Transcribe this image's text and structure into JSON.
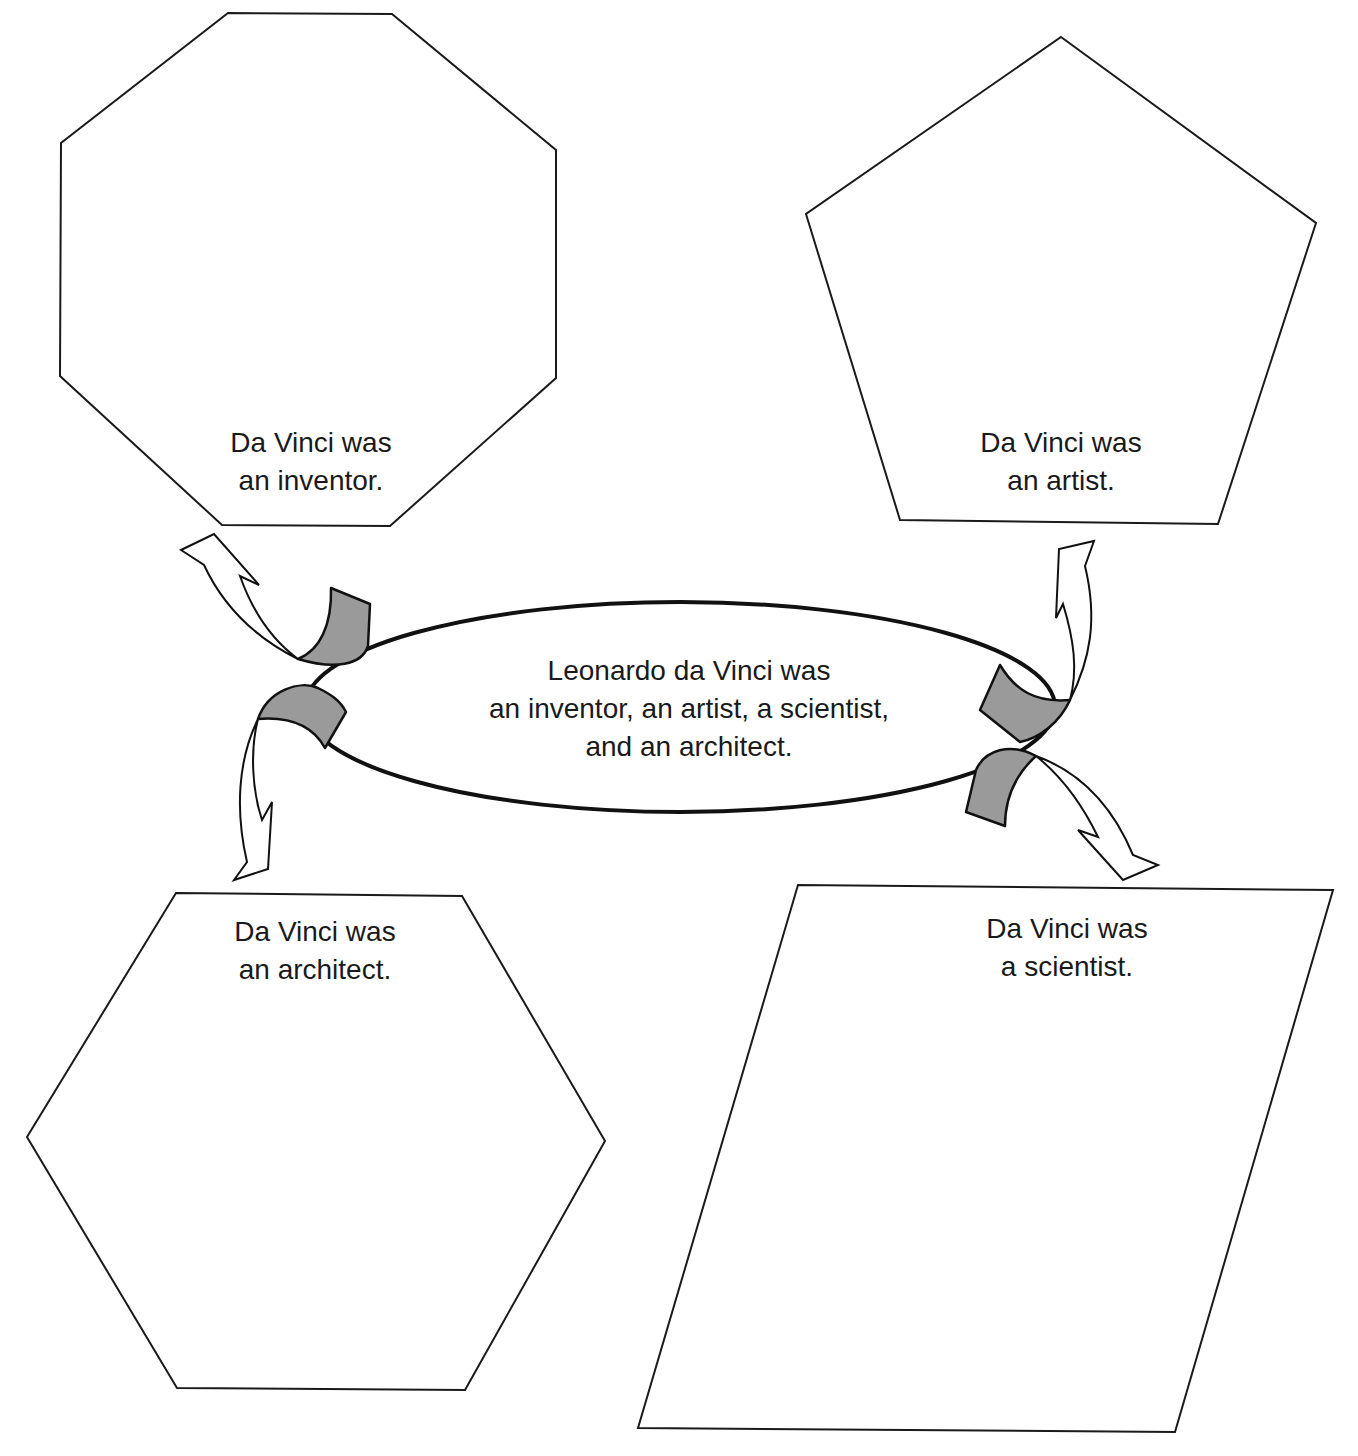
{
  "diagram": {
    "center": {
      "lines": [
        "Leonardo da Vinci was",
        "an inventor, an artist, a scientist,",
        "and an architect."
      ]
    },
    "nodes": [
      {
        "id": "inventor",
        "shape": "octagon",
        "lines": [
          "Da Vinci was",
          "an inventor."
        ]
      },
      {
        "id": "artist",
        "shape": "pentagon",
        "lines": [
          "Da Vinci was",
          "an artist."
        ]
      },
      {
        "id": "architect",
        "shape": "hexagon",
        "lines": [
          "Da Vinci was",
          "an architect."
        ]
      },
      {
        "id": "scientist",
        "shape": "parallelogram",
        "lines": [
          "Da Vinci was",
          "a scientist."
        ]
      }
    ],
    "connectors": [
      {
        "from": "center",
        "to": "inventor",
        "style": "curved-hollow-arrow-with-gray-ribbon"
      },
      {
        "from": "center",
        "to": "artist",
        "style": "curved-hollow-arrow-with-gray-ribbon"
      },
      {
        "from": "center",
        "to": "architect",
        "style": "curved-hollow-arrow-with-gray-ribbon"
      },
      {
        "from": "center",
        "to": "scientist",
        "style": "curved-hollow-arrow-with-gray-ribbon"
      }
    ],
    "colors": {
      "stroke": "#111111",
      "ribbon_fill": "#9a9a9a",
      "background": "#ffffff"
    }
  }
}
